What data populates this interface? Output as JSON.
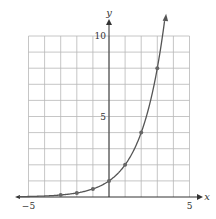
{
  "chart_data": {
    "type": "line",
    "title": "",
    "function": "y = 2^x",
    "xlabel": "x",
    "ylabel": "y",
    "xlim": [
      -5,
      5
    ],
    "ylim": [
      0,
      10
    ],
    "grid": true,
    "x_ticks_labeled": [
      {
        "value": -5,
        "label": "−5"
      },
      {
        "value": 5,
        "label": "5"
      }
    ],
    "y_ticks_labeled": [
      {
        "value": 5,
        "label": "5"
      },
      {
        "value": 10,
        "label": "10"
      }
    ],
    "series": [
      {
        "name": "y = 2^x",
        "points": [
          {
            "x": -3,
            "y": 0.125
          },
          {
            "x": -2,
            "y": 0.25
          },
          {
            "x": -1,
            "y": 0.5
          },
          {
            "x": 0,
            "y": 1
          },
          {
            "x": 1,
            "y": 2
          },
          {
            "x": 2,
            "y": 4
          },
          {
            "x": 3,
            "y": 8
          }
        ]
      }
    ]
  },
  "colors": {
    "grid": "#b8b8b8",
    "axis": "#333333",
    "curve": "#555555",
    "points": "#666666"
  }
}
